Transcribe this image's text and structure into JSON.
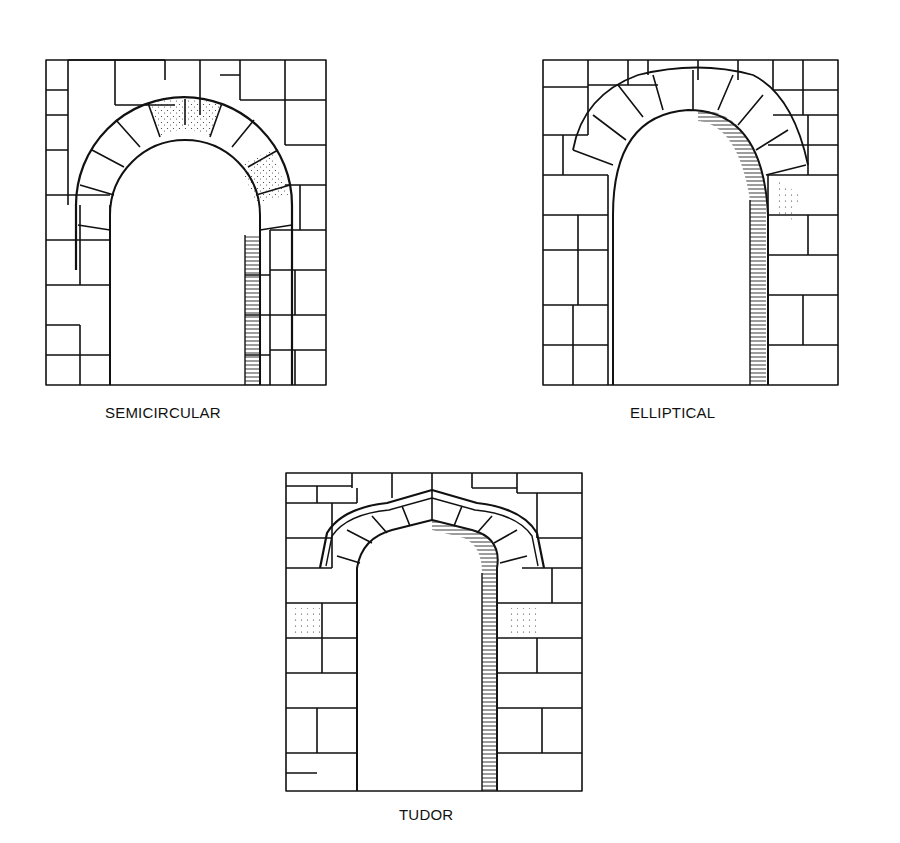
{
  "figure": {
    "arches": [
      {
        "id": "semicircular",
        "label": "SEMICIRCULAR"
      },
      {
        "id": "elliptical",
        "label": "ELLIPTICAL"
      },
      {
        "id": "tudor",
        "label": "TUDOR"
      }
    ]
  },
  "colors": {
    "line": "#111111",
    "background": "#ffffff"
  }
}
